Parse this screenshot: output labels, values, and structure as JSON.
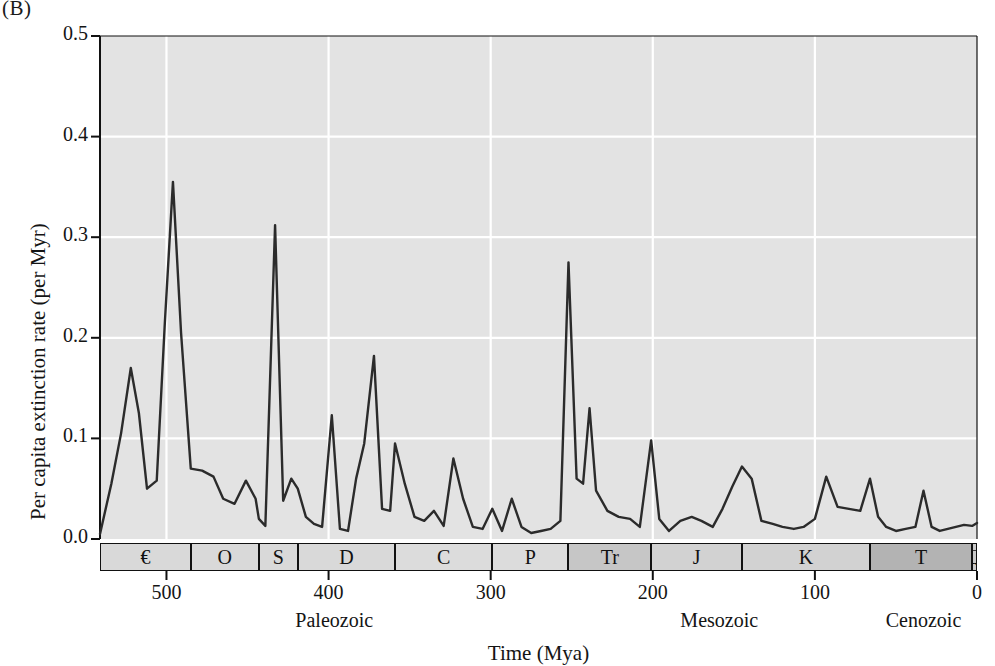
{
  "panel": {
    "label": "(B)"
  },
  "axes": {
    "ylabel": "Per capita extinction rate (per Myr)",
    "xlabel": "Time (Mya)",
    "yticks": [
      "0.0",
      "0.1",
      "0.2",
      "0.3",
      "0.4",
      "0.5"
    ],
    "xticks": [
      "500",
      "400",
      "300",
      "200",
      "100",
      "0"
    ]
  },
  "eras": [
    {
      "name": "Paleozoic",
      "start": 541,
      "end": 252
    },
    {
      "name": "Mesozoic",
      "start": 252,
      "end": 66
    },
    {
      "name": "Cenozoic",
      "start": 66,
      "end": 0
    }
  ],
  "periods": [
    {
      "symbol": "€",
      "name": "Cambrian",
      "start": 541,
      "end": 485,
      "shade": "#d9d9d9"
    },
    {
      "symbol": "O",
      "name": "Ordovician",
      "start": 485,
      "end": 443,
      "shade": "#d9d9d9"
    },
    {
      "symbol": "S",
      "name": "Silurian",
      "start": 443,
      "end": 419,
      "shade": "#d9d9d9"
    },
    {
      "symbol": "D",
      "name": "Devonian",
      "start": 419,
      "end": 359,
      "shade": "#d9d9d9"
    },
    {
      "symbol": "C",
      "name": "Carboniferous",
      "start": 359,
      "end": 299,
      "shade": "#dcdcdc"
    },
    {
      "symbol": "P",
      "name": "Permian",
      "start": 299,
      "end": 252,
      "shade": "#dcdcdc"
    },
    {
      "symbol": "Tr",
      "name": "Triassic",
      "start": 252,
      "end": 201,
      "shade": "#c6c6c6"
    },
    {
      "symbol": "J",
      "name": "Jurassic",
      "start": 201,
      "end": 145,
      "shade": "#d2d2d2"
    },
    {
      "symbol": "K",
      "name": "Cretaceous",
      "start": 145,
      "end": 66,
      "shade": "#d2d2d2"
    },
    {
      "symbol": "T",
      "name": "Tertiary",
      "start": 66,
      "end": 3,
      "shade": "#b3b3b3"
    },
    {
      "symbol": "Q",
      "name": "Quaternary",
      "start": 3,
      "end": 0,
      "shade": "#c9c9c9"
    }
  ],
  "style": {
    "plot_background": "#e3e3e3",
    "gridline_color": "#ffffff",
    "line_color": "#2b2b2b",
    "frame_color": "#111111"
  },
  "chart_data": {
    "type": "line",
    "title": "",
    "xlabel": "Time (Mya)",
    "ylabel": "Per capita extinction rate (per Myr)",
    "xlim": [
      541,
      0
    ],
    "ylim": [
      0.0,
      0.5
    ],
    "x_axis_reversed": true,
    "grid": true,
    "legend": "none",
    "series": [
      {
        "name": "Per capita extinction rate",
        "x": [
          541,
          534,
          528,
          522,
          517,
          512,
          506,
          501,
          496,
          491,
          485,
          478,
          471,
          465,
          458,
          451,
          445,
          443,
          439,
          433,
          428,
          423,
          419,
          414,
          409,
          404,
          398,
          393,
          388,
          383,
          378,
          372,
          367,
          362,
          359,
          353,
          347,
          341,
          335,
          329,
          323,
          317,
          311,
          305,
          299,
          293,
          287,
          281,
          275,
          269,
          263,
          257,
          252,
          247,
          243,
          239,
          235,
          228,
          221,
          214,
          208,
          201,
          196,
          190,
          183,
          176,
          170,
          163,
          157,
          151,
          145,
          139,
          133,
          126,
          120,
          113,
          107,
          100,
          93,
          86,
          79,
          72,
          66,
          61,
          56,
          50,
          44,
          38,
          33,
          28,
          23,
          18,
          13,
          8,
          3,
          0
        ],
        "y": [
          0.005,
          0.055,
          0.105,
          0.17,
          0.125,
          0.05,
          0.058,
          0.215,
          0.355,
          0.205,
          0.07,
          0.068,
          0.062,
          0.04,
          0.035,
          0.058,
          0.04,
          0.02,
          0.013,
          0.312,
          0.038,
          0.06,
          0.05,
          0.022,
          0.015,
          0.012,
          0.123,
          0.01,
          0.008,
          0.06,
          0.095,
          0.182,
          0.03,
          0.028,
          0.095,
          0.055,
          0.022,
          0.018,
          0.028,
          0.013,
          0.08,
          0.04,
          0.012,
          0.01,
          0.03,
          0.008,
          0.04,
          0.012,
          0.006,
          0.008,
          0.01,
          0.018,
          0.275,
          0.06,
          0.055,
          0.13,
          0.048,
          0.028,
          0.022,
          0.02,
          0.012,
          0.098,
          0.02,
          0.008,
          0.018,
          0.022,
          0.018,
          0.012,
          0.03,
          0.052,
          0.072,
          0.06,
          0.018,
          0.015,
          0.012,
          0.01,
          0.012,
          0.02,
          0.062,
          0.032,
          0.03,
          0.028,
          0.06,
          0.022,
          0.012,
          0.008,
          0.01,
          0.012,
          0.048,
          0.012,
          0.008,
          0.01,
          0.012,
          0.014,
          0.013,
          0.016
        ]
      }
    ]
  }
}
